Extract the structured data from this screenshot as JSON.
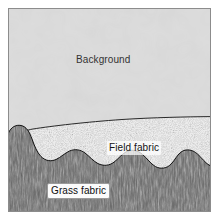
{
  "figure": {
    "width": 219,
    "height": 220,
    "page_background": "#ffffff",
    "border_color": "#8c8c8c",
    "frame": {
      "x": 8,
      "y": 8,
      "width": 203,
      "height": 204
    }
  },
  "regions": [
    {
      "key": "background",
      "label": "Background",
      "fill": "#dcdcdc",
      "texture": "flat-light-gray-mottled",
      "label_x": 76,
      "label_y": 54
    },
    {
      "key": "field_fabric",
      "label": "Field fabric",
      "fill": "#e9e9e9",
      "texture": "fine-random-stipple",
      "label_x": 107,
      "label_y": 141
    },
    {
      "key": "grass_fabric",
      "label": "Grass fabric",
      "fill": "#6f6f6f",
      "texture": "vertical-blade-streaks",
      "label_x": 47,
      "label_y": 183
    }
  ],
  "boundaries": {
    "field_top": "curve rising left-to-right from y=137 at x=30 to y=117 at x=211",
    "grass_top": "undulating wavy line with rounded bumps across full width",
    "outline_color": "#141414"
  },
  "icons": {
    "frame": "rectangle-frame-icon"
  }
}
